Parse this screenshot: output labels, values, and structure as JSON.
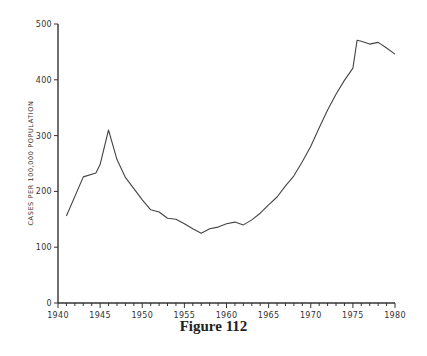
{
  "caption": "Figure 112",
  "chart_data": {
    "type": "line",
    "title": "",
    "xlabel": "",
    "ylabel": "CASES PER 100,000 POPULATION",
    "xlim": [
      1940,
      1980
    ],
    "ylim": [
      0,
      500
    ],
    "x_ticks": [
      1940,
      1945,
      1950,
      1955,
      1960,
      1965,
      1970,
      1975,
      1980
    ],
    "y_ticks": [
      0,
      100,
      200,
      300,
      400,
      500
    ],
    "grid": false,
    "legend": null,
    "series": [
      {
        "name": "Cases per 100,000 population",
        "x": [
          1941,
          1943,
          1944.5,
          1945,
          1946,
          1947,
          1948,
          1950,
          1951,
          1952,
          1953,
          1954,
          1955,
          1956,
          1957,
          1958,
          1959,
          1960,
          1961,
          1962,
          1963,
          1964,
          1965,
          1966,
          1967,
          1968,
          1969,
          1970,
          1971,
          1972,
          1973,
          1974,
          1975,
          1975.5,
          1976,
          1977,
          1978,
          1979,
          1980
        ],
        "values": [
          156,
          226,
          233,
          248,
          310,
          257,
          225,
          185,
          167,
          163,
          152,
          150,
          142,
          133,
          125,
          133,
          136,
          142,
          145,
          140,
          149,
          161,
          176,
          190,
          210,
          228,
          253,
          281,
          314,
          346,
          374,
          399,
          421,
          471,
          469,
          464,
          467,
          457,
          446
        ]
      }
    ]
  }
}
